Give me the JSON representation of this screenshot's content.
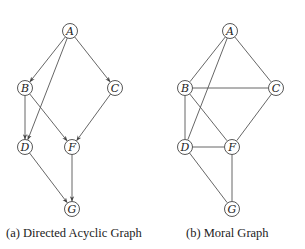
{
  "figures": [
    {
      "id": "dag",
      "caption": "(a) Directed Acyclic Graph",
      "directed": true,
      "nodes": [
        {
          "id": "A",
          "label": "A",
          "x": 70,
          "y": 31
        },
        {
          "id": "B",
          "label": "B",
          "x": 25,
          "y": 88
        },
        {
          "id": "C",
          "label": "C",
          "x": 115,
          "y": 88
        },
        {
          "id": "D",
          "label": "D",
          "x": 25,
          "y": 147
        },
        {
          "id": "F",
          "label": "F",
          "x": 72,
          "y": 147
        },
        {
          "id": "G",
          "label": "G",
          "x": 72,
          "y": 209
        }
      ],
      "edges": [
        [
          "A",
          "B"
        ],
        [
          "A",
          "C"
        ],
        [
          "A",
          "D"
        ],
        [
          "B",
          "D"
        ],
        [
          "B",
          "F"
        ],
        [
          "C",
          "F"
        ],
        [
          "D",
          "G"
        ],
        [
          "F",
          "G"
        ]
      ]
    },
    {
      "id": "moral",
      "caption": "(b) Moral Graph",
      "directed": false,
      "nodes": [
        {
          "id": "A",
          "label": "A",
          "x": 230,
          "y": 31
        },
        {
          "id": "B",
          "label": "B",
          "x": 185,
          "y": 88
        },
        {
          "id": "C",
          "label": "C",
          "x": 276,
          "y": 88
        },
        {
          "id": "D",
          "label": "D",
          "x": 185,
          "y": 147
        },
        {
          "id": "F",
          "label": "F",
          "x": 232,
          "y": 147
        },
        {
          "id": "G",
          "label": "G",
          "x": 232,
          "y": 209
        }
      ],
      "edges": [
        [
          "A",
          "B"
        ],
        [
          "A",
          "C"
        ],
        [
          "A",
          "D"
        ],
        [
          "B",
          "C"
        ],
        [
          "B",
          "D"
        ],
        [
          "B",
          "F"
        ],
        [
          "C",
          "F"
        ],
        [
          "D",
          "F"
        ],
        [
          "D",
          "G"
        ],
        [
          "F",
          "G"
        ]
      ]
    }
  ],
  "style": {
    "node_radius": 7.5,
    "edge_color": "#555555",
    "node_stroke": "#444444",
    "text_color": "#222222"
  }
}
